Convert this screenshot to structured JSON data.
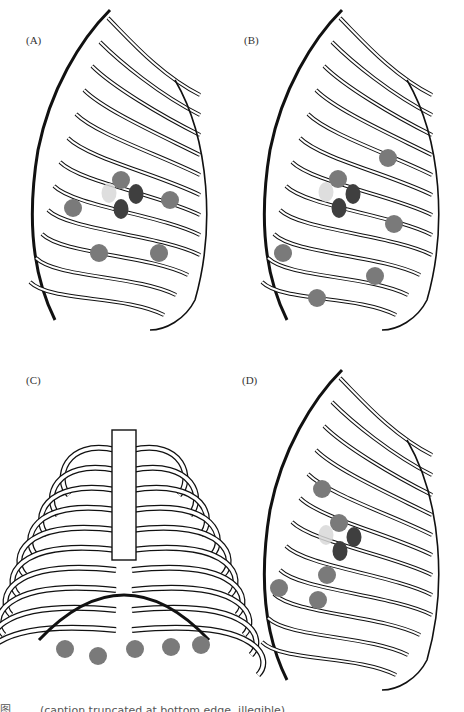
{
  "figure": {
    "panels": [
      {
        "id": "A",
        "label": "(A)",
        "view": "lateral rib cage",
        "dots": [
          {
            "x": 121,
            "y": 180,
            "shade": "mid"
          },
          {
            "x": 136,
            "y": 194,
            "shade": "dark"
          },
          {
            "x": 121,
            "y": 209,
            "shade": "dark"
          },
          {
            "x": 109,
            "y": 193,
            "shade": "light"
          },
          {
            "x": 170,
            "y": 200,
            "shade": "mid"
          },
          {
            "x": 73,
            "y": 208,
            "shade": "mid"
          },
          {
            "x": 99,
            "y": 253,
            "shade": "mid"
          },
          {
            "x": 159,
            "y": 253,
            "shade": "mid"
          }
        ]
      },
      {
        "id": "B",
        "label": "(B)",
        "view": "lateral rib cage",
        "dots": [
          {
            "x": 388,
            "y": 158,
            "shade": "mid"
          },
          {
            "x": 338,
            "y": 179,
            "shade": "mid"
          },
          {
            "x": 353,
            "y": 194,
            "shade": "dark"
          },
          {
            "x": 339,
            "y": 208,
            "shade": "dark"
          },
          {
            "x": 326,
            "y": 192,
            "shade": "light"
          },
          {
            "x": 394,
            "y": 224,
            "shade": "mid"
          },
          {
            "x": 283,
            "y": 253,
            "shade": "mid"
          },
          {
            "x": 375,
            "y": 276,
            "shade": "mid"
          },
          {
            "x": 317,
            "y": 298,
            "shade": "mid"
          }
        ]
      },
      {
        "id": "C",
        "label": "(C)",
        "view": "anterior rib cage",
        "dots": [
          {
            "x": 65,
            "y": 649,
            "shade": "mid"
          },
          {
            "x": 98,
            "y": 656,
            "shade": "mid"
          },
          {
            "x": 135,
            "y": 649,
            "shade": "mid"
          },
          {
            "x": 171,
            "y": 647,
            "shade": "mid"
          },
          {
            "x": 201,
            "y": 645,
            "shade": "mid"
          }
        ]
      },
      {
        "id": "D",
        "label": "(D)",
        "view": "lateral rib cage",
        "dots": [
          {
            "x": 322,
            "y": 489,
            "shade": "mid"
          },
          {
            "x": 339,
            "y": 523,
            "shade": "mid"
          },
          {
            "x": 354,
            "y": 537,
            "shade": "dark"
          },
          {
            "x": 340,
            "y": 551,
            "shade": "dark"
          },
          {
            "x": 326,
            "y": 535,
            "shade": "light"
          },
          {
            "x": 327,
            "y": 575,
            "shade": "mid"
          },
          {
            "x": 279,
            "y": 588,
            "shade": "mid"
          },
          {
            "x": 318,
            "y": 600,
            "shade": "mid"
          }
        ]
      }
    ],
    "colors": {
      "mid": "#7a7a7a",
      "dark": "#3f3f3f",
      "light": "#d8d8d8",
      "line": "#111111"
    },
    "caption": "图 …… (caption truncated at bottom edge, illegible)"
  }
}
